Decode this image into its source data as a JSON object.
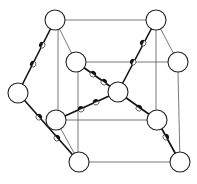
{
  "diagram": {
    "atoms": [
      {
        "id": "top-left",
        "x": 55,
        "y": 20
      },
      {
        "id": "top-right",
        "x": 156,
        "y": 20
      },
      {
        "id": "upper-inner-left",
        "x": 76,
        "y": 62
      },
      {
        "id": "upper-right",
        "x": 178,
        "y": 62
      },
      {
        "id": "left",
        "x": 18,
        "y": 93
      },
      {
        "id": "center",
        "x": 118,
        "y": 92
      },
      {
        "id": "lower-inner-left",
        "x": 56,
        "y": 120
      },
      {
        "id": "lower-inner-right",
        "x": 157,
        "y": 120
      },
      {
        "id": "bottom-left",
        "x": 79,
        "y": 162
      },
      {
        "id": "bottom-right",
        "x": 180,
        "y": 162
      }
    ],
    "atom_radius": 10,
    "colors": {
      "bond": "#111111",
      "edge": "#555555",
      "atom_fill": "#ffffff"
    }
  }
}
